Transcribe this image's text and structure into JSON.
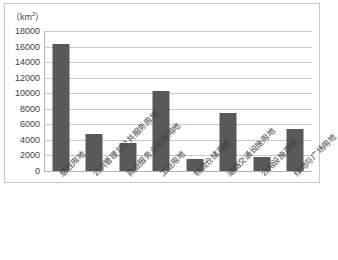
{
  "chart_data": {
    "type": "bar",
    "title": "",
    "subtitle": "",
    "xlabel": "",
    "ylabel": "（km²）",
    "ylim": [
      0,
      18000
    ],
    "ytick_step": 2000,
    "yticks": [
      "0",
      "2000",
      "4000",
      "6000",
      "8000",
      "10000",
      "12000",
      "14000",
      "16000",
      "18000"
    ],
    "grid": true,
    "legend": false,
    "legend_position": "none",
    "bar_color": "#595959",
    "grid_color": "#c9c9c9",
    "axis_color": "#b5b5b5",
    "categories": [
      "居住用地",
      "公共管理与公共服务用地",
      "商业服务业设施用地",
      "工业用地",
      "物流仓储用地",
      "道路交通设施用地",
      "公用设施用地",
      "绿地与广场用地"
    ],
    "values": [
      16300,
      4750,
      3580,
      10300,
      1550,
      7400,
      1800,
      5450
    ]
  }
}
